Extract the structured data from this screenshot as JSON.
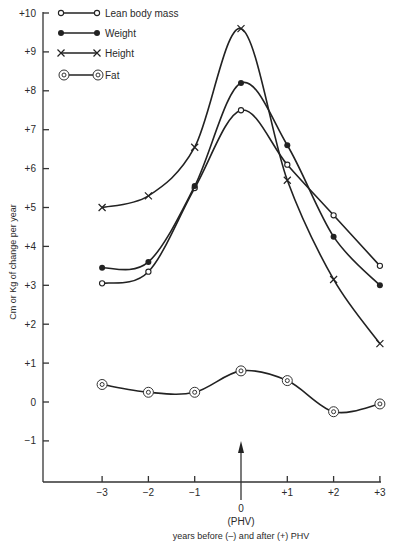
{
  "chart_data": {
    "type": "line",
    "title": "",
    "xlabel_value": "0",
    "xlabel_marker": "(PHV)",
    "xlabel": "years before (–) and after (+) PHV",
    "ylabel": "Cm or Kg of change per year",
    "x": [
      -3,
      -2,
      -1,
      0,
      1,
      2,
      3
    ],
    "x_tick_labels": [
      "−3",
      "−2",
      "−1",
      "",
      "+1",
      "+2",
      "+3"
    ],
    "y_tick_labels": [
      "+10",
      "+9",
      "+8",
      "+7",
      "+6",
      "+5",
      "+4",
      "+3",
      "+2",
      "+1",
      "0",
      "−1"
    ],
    "y_ticks": [
      10,
      9,
      8,
      7,
      6,
      5,
      4,
      3,
      2,
      1,
      0,
      -1
    ],
    "ylim": [
      -2,
      10
    ],
    "xlim": [
      -4,
      3
    ],
    "grid": false,
    "legend_position": "top-left",
    "annotations": [
      "arrow at x=0 marking PHV (peak height velocity)"
    ],
    "series": [
      {
        "name": "Lean body mass",
        "marker": "open-circle",
        "values": [
          3.05,
          3.35,
          5.5,
          7.5,
          6.1,
          4.8,
          3.5
        ]
      },
      {
        "name": "Weight",
        "marker": "filled-circle",
        "values": [
          3.45,
          3.6,
          5.55,
          8.2,
          6.6,
          4.25,
          3.0
        ]
      },
      {
        "name": "Height",
        "marker": "cross",
        "values": [
          5.0,
          5.3,
          6.55,
          9.6,
          5.7,
          3.15,
          1.5
        ]
      },
      {
        "name": "Fat",
        "marker": "double-circle",
        "values": [
          0.45,
          0.25,
          0.25,
          0.8,
          0.55,
          -0.25,
          -0.05
        ]
      }
    ]
  }
}
